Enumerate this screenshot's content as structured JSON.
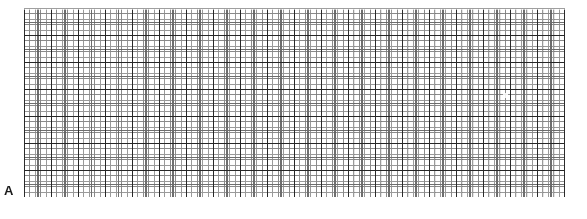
{
  "figure": {
    "panel_label": "A",
    "background_color": "#ffffff",
    "width_px": 587,
    "height_px": 219
  },
  "grid": {
    "name": "chart-recorder-grid-paper",
    "x_px": 24,
    "y_px": 8,
    "width_px": 541,
    "height_px": 189,
    "fine_spacing_px": 5.4,
    "medium_spacing_px": 13.5,
    "major_spacing_px": 27.0,
    "fine_color": "#9a9a9a",
    "medium_color": "#6e6e6e",
    "major_color": "#2b2b2b",
    "paper_color": "#ffffff",
    "fine_columns": 100,
    "fine_rows": 35,
    "major_columns": 20,
    "major_rows": 7
  },
  "chart_data": {
    "type": "line",
    "title": "",
    "subtitle": "",
    "xlabel": "",
    "ylabel": "",
    "annotations": [
      "A"
    ],
    "legend": [],
    "legend_position": "none",
    "grid": true,
    "series": [
      {
        "name": "trace",
        "x": [],
        "values": [],
        "note": "flat baseline; no deflections visible on the grid paper"
      }
    ],
    "x": [],
    "categories": [],
    "values": [],
    "xlim": [
      0,
      100
    ],
    "ylim": [
      0,
      35
    ],
    "x_tick_labels": [],
    "y_tick_labels": []
  }
}
